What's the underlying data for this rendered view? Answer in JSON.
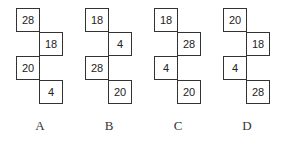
{
  "options": [
    {
      "label": "A",
      "cells": [
        "28",
        "18",
        "20",
        "4"
      ]
    },
    {
      "label": "B",
      "cells": [
        "18",
        "4",
        "28",
        "20"
      ]
    },
    {
      "label": "C",
      "cells": [
        "18",
        "28",
        "4",
        "20"
      ]
    },
    {
      "label": "D",
      "cells": [
        "20",
        "18",
        "4",
        "28"
      ]
    }
  ]
}
